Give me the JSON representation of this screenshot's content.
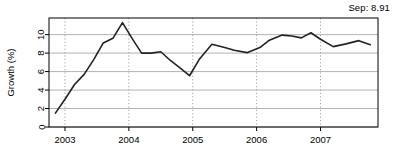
{
  "annotation": {
    "text": "Sep: 8.91"
  },
  "chart_data": {
    "type": "line",
    "title": "",
    "xlabel": "",
    "ylabel": "Growth (%)",
    "xlim": [
      2002.75,
      2007.9
    ],
    "ylim": [
      0,
      11.8
    ],
    "xticks": [
      2003,
      2004,
      2005,
      2006,
      2007
    ],
    "xticklabels": [
      "2003",
      "2004",
      "2005",
      "2006",
      "2007"
    ],
    "yticks": [
      0,
      2,
      4,
      6,
      8,
      10
    ],
    "yticklabels": [
      "0",
      "2",
      "4",
      "6",
      "8",
      "10"
    ],
    "grid": {
      "horizontal": "solid",
      "vertical": "dotted",
      "horizontal_color": "#aaaaaa",
      "vertical_color": "#999999"
    },
    "legend": "none",
    "line_color": "#222222",
    "line_width": 1.6,
    "x": [
      2002.85,
      2003.0,
      2003.15,
      2003.3,
      2003.45,
      2003.6,
      2003.75,
      2003.9,
      2004.05,
      2004.2,
      2004.35,
      2004.5,
      2004.65,
      2004.8,
      2004.95,
      2005.1,
      2005.3,
      2005.5,
      2005.65,
      2005.85,
      2006.05,
      2006.2,
      2006.4,
      2006.55,
      2006.7,
      2006.85,
      2007.0,
      2007.2,
      2007.4,
      2007.6,
      2007.78
    ],
    "y": [
      1.5,
      3.0,
      4.6,
      5.7,
      7.3,
      9.1,
      9.6,
      11.3,
      9.6,
      8.0,
      8.0,
      8.15,
      7.2,
      6.4,
      5.55,
      7.3,
      8.95,
      8.6,
      8.3,
      8.05,
      8.6,
      9.4,
      9.95,
      9.85,
      9.65,
      10.2,
      9.5,
      8.7,
      9.0,
      9.35,
      8.91
    ],
    "series_name": "Growth",
    "final_value": 8.91,
    "final_label": "Sep: 8.91"
  }
}
